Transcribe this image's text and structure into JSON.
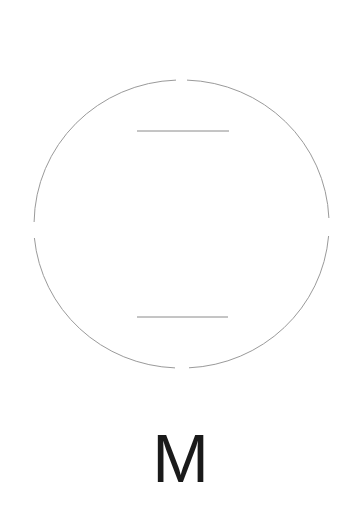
{
  "diagram": {
    "type": "symbol",
    "circle": {
      "cx": 181,
      "cy": 224,
      "rx": 147,
      "ry": 144,
      "stroke": "#9a9a9a",
      "gaps": [
        "top",
        "right",
        "bottom",
        "left"
      ]
    },
    "bars": [
      {
        "x1": 137,
        "x2": 229,
        "y": 131,
        "stroke": "#8a8a8a"
      },
      {
        "x1": 137,
        "x2": 228,
        "y": 317,
        "stroke": "#8a8a8a"
      }
    ],
    "label": "M",
    "label_color": "#1a1a1a"
  }
}
